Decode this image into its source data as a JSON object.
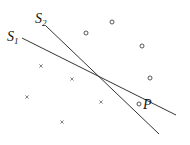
{
  "diagram": {
    "type": "linear-separators",
    "lines": [
      {
        "id": "S1",
        "label": "S",
        "subscript": "1",
        "x1": 22,
        "y1": 38,
        "x2": 176,
        "y2": 115,
        "label_x": 7,
        "label_y": 41
      },
      {
        "id": "S2",
        "label": "S",
        "subscript": "2",
        "x1": 46,
        "y1": 26,
        "x2": 159,
        "y2": 134,
        "label_x": 35,
        "label_y": 23
      }
    ],
    "circles": [
      {
        "x": 112,
        "y": 22
      },
      {
        "x": 86,
        "y": 33
      },
      {
        "x": 142,
        "y": 46
      },
      {
        "x": 150,
        "y": 78
      },
      {
        "x": 139,
        "y": 104
      }
    ],
    "crosses": [
      {
        "x": 41,
        "y": 66
      },
      {
        "x": 72,
        "y": 79
      },
      {
        "x": 27,
        "y": 97
      },
      {
        "x": 101,
        "y": 102
      },
      {
        "x": 62,
        "y": 122
      }
    ],
    "point_label": {
      "text": "P",
      "x": 143,
      "y": 109
    }
  }
}
